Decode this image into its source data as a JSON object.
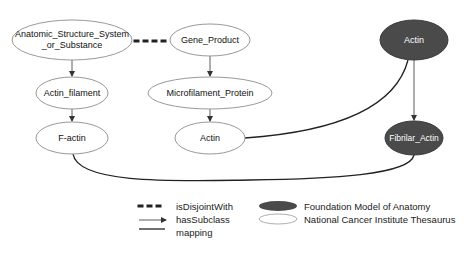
{
  "colors": {
    "fma_fill": "#4a4a4a",
    "nci_fill": "#ffffff",
    "nci_stroke": "#9a9a9a",
    "edge": "#333333",
    "fma_text": "#ffffff",
    "nci_text": "#111111"
  },
  "nodes": {
    "anatomic": {
      "label_line1": "Anatomic_Structure_System",
      "label_line2": "_or_Substance",
      "source": "NCI"
    },
    "gene_product": {
      "label": "Gene_Product",
      "source": "NCI"
    },
    "actin_fma": {
      "label": "Actin",
      "source": "FMA"
    },
    "actin_filament": {
      "label": "Actin_filament",
      "source": "NCI"
    },
    "microfilament_protein": {
      "label": "Microfilament_Protein",
      "source": "NCI"
    },
    "f_actin": {
      "label": "F-actin",
      "source": "NCI"
    },
    "actin_nci": {
      "label": "Actin",
      "source": "NCI"
    },
    "fibrilar_actin": {
      "label": "Fibrilar_Actin",
      "source": "FMA"
    }
  },
  "edges": [
    {
      "from": "Anatomic_Structure_System_or_Substance",
      "to": "Gene_Product",
      "type": "isDisjointWith"
    },
    {
      "from": "Anatomic_Structure_System_or_Substance",
      "to": "Actin_filament",
      "type": "hasSubclass"
    },
    {
      "from": "Actin_filament",
      "to": "F-actin",
      "type": "hasSubclass"
    },
    {
      "from": "Gene_Product",
      "to": "Microfilament_Protein",
      "type": "hasSubclass"
    },
    {
      "from": "Microfilament_Protein",
      "to": "Actin",
      "type": "hasSubclass"
    },
    {
      "from": "Actin (FMA)",
      "to": "Fibrilar_Actin",
      "type": "hasSubclass"
    },
    {
      "from": "Actin (NCI)",
      "to": "Actin (FMA)",
      "type": "mapping"
    },
    {
      "from": "F-actin",
      "to": "Fibrilar_Actin",
      "type": "mapping"
    }
  ],
  "legend": {
    "edge_types": [
      {
        "label": "isDisjointWith",
        "style": "dotted"
      },
      {
        "label": "hasSubclass",
        "style": "arrow"
      },
      {
        "label": "mapping",
        "style": "solid"
      }
    ],
    "node_types": [
      {
        "label": "Foundation Model of Anatomy",
        "style": "filled-dark"
      },
      {
        "label": "National Cancer Institute Thesaurus",
        "style": "outline"
      }
    ]
  }
}
